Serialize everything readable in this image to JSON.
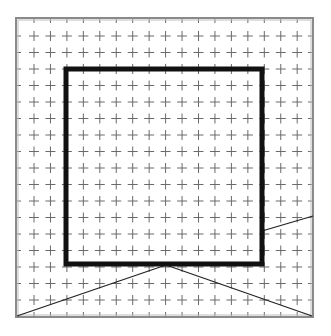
{
  "diagram": {
    "title": "",
    "canvas": {
      "width": 331,
      "height": 336,
      "background": "#ffffff"
    },
    "frame": {
      "x": 16,
      "y": 18,
      "width": 297,
      "height": 299,
      "color": "#8a8a8a",
      "inner_color": "#bdbdbd"
    },
    "grid": {
      "origin_x": 34,
      "origin_y": 36,
      "spacing_x": 16.45,
      "spacing_y": 16.5,
      "cols": 17,
      "rows": 17,
      "arm": 5,
      "color": "#6a6a6a"
    },
    "inner_square": {
      "x": 66,
      "y": 69,
      "width": 196,
      "height": 195,
      "stroke": "#111111",
      "stroke_width": 5
    },
    "lines": [
      {
        "name": "right-slope-line",
        "x1": 262,
        "y1": 231,
        "x2": 313,
        "y2": 216
      },
      {
        "name": "left-bottom-diagonal",
        "x1": 166,
        "y1": 265,
        "x2": 17,
        "y2": 316
      },
      {
        "name": "right-bottom-diagonal",
        "x1": 166,
        "y1": 265,
        "x2": 312,
        "y2": 316
      }
    ],
    "line_color": "#222222"
  }
}
